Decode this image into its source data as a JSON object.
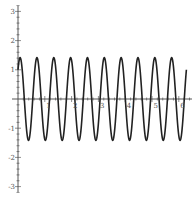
{
  "chart_data": {
    "type": "line",
    "title": "",
    "xlabel": "",
    "ylabel": "",
    "function": "sin(10x) + cos(10x)",
    "xlim": [
      0,
      6.4
    ],
    "ylim": [
      -3.2,
      3.3
    ],
    "domain": [
      0,
      6.2832
    ],
    "amplitude": 1.414,
    "periods": 10,
    "x_ticks": [
      1,
      2,
      3,
      4,
      5,
      6
    ],
    "x_tick_labels": [
      "1",
      "2",
      "3",
      "4",
      "5",
      "6"
    ],
    "x_minor_step": 0.2,
    "y_ticks": [
      3,
      2,
      1,
      -1,
      -2,
      -3
    ],
    "y_tick_labels": [
      "3",
      "2",
      "1",
      "-1",
      "-2",
      "-3"
    ],
    "y_minor_step": 0.2,
    "grid": false,
    "legend": "none",
    "series": [
      {
        "name": "f(x)",
        "color": "#222222"
      }
    ],
    "axis_color": "#444444"
  }
}
